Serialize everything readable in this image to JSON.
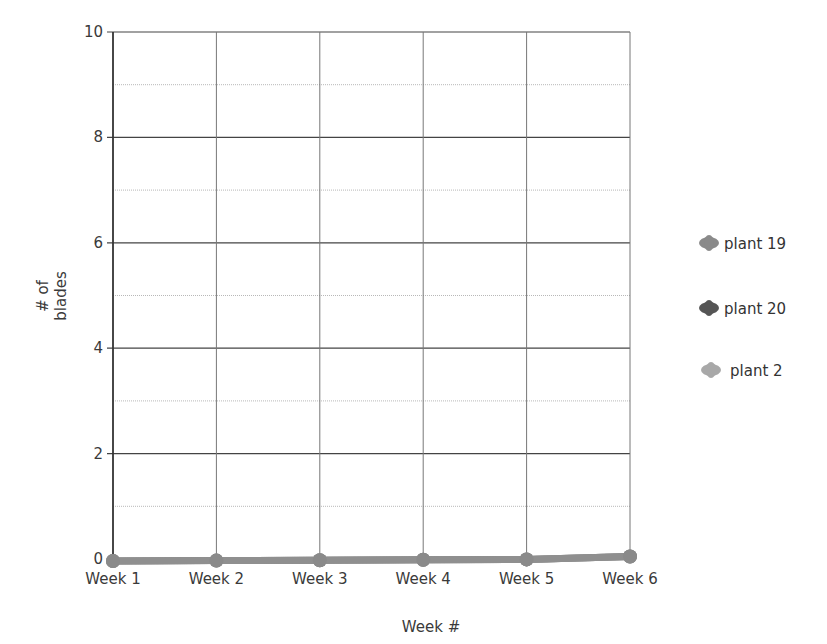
{
  "chart_data": {
    "type": "line",
    "title": "",
    "xlabel": "Week #",
    "ylabel": "# of blades",
    "ylabel_lines": [
      "# of",
      "blades"
    ],
    "categories": [
      "Week 1",
      "Week 2",
      "Week 3",
      "Week 4",
      "Week 5",
      "Week 6"
    ],
    "ylim": [
      0,
      10
    ],
    "yticks": [
      0,
      2,
      4,
      6,
      8,
      10
    ],
    "grid": true,
    "legend_position": "right",
    "series": [
      {
        "name": "plant 19",
        "color": "#8a8a8a",
        "values": [
          0,
          0,
          0,
          0,
          0,
          0
        ]
      },
      {
        "name": "plant 20",
        "color": "#555555",
        "values": [
          0,
          0,
          0,
          0,
          0,
          0
        ]
      },
      {
        "name": "plant 2",
        "color": "#a8a8a8",
        "values": [
          0,
          0,
          0,
          0,
          0,
          0
        ]
      }
    ]
  },
  "legend": {
    "items": [
      {
        "label": "plant 19",
        "color": "#8a8a8a"
      },
      {
        "label": "plant 20",
        "color": "#555555"
      },
      {
        "label": "plant 2",
        "color": "#a8a8a8"
      }
    ]
  }
}
